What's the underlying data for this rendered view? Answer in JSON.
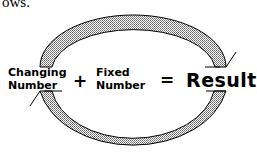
{
  "caption": "ows.",
  "diagram": {
    "term1_line1": "Changing",
    "term1_line2": "Number",
    "plus": "+",
    "term2_line1": "Fixed",
    "term2_line2": "Number",
    "equals": "=",
    "result": "Result",
    "arrows": [
      "top-arc-arrow: Changing Number to Result",
      "bottom-arc-arrow: Result back to Changing Number"
    ]
  }
}
